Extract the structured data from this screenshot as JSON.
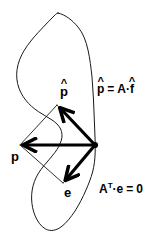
{
  "figure": {
    "background_color": "#ffffff",
    "ink_color": "#000000",
    "width": 161,
    "height": 240
  },
  "labels": {
    "p_hat": {
      "base": "p",
      "hat": "^",
      "text": "p̂"
    },
    "p": {
      "text": "p"
    },
    "e": {
      "text": "e"
    }
  },
  "equations": {
    "projection": {
      "lhs_base": "p",
      "lhs_hat": "^",
      "equals": "=",
      "rhs_matrix": "A",
      "rhs_dot": "·",
      "rhs_vector_base": "f",
      "rhs_vector_hat": "^",
      "text": "p̂ = A·f̂"
    },
    "orthogonality": {
      "matrix": "A",
      "transpose": "T",
      "dot": "·",
      "vector": "e",
      "equals": "=",
      "zero": "0",
      "text": "Aᵀ·e = 0"
    }
  },
  "geometry": {
    "origin": {
      "x": 95,
      "y": 145
    },
    "vectors": [
      {
        "name": "p-hat-vector",
        "from": {
          "x": 95,
          "y": 145
        },
        "to": {
          "x": 57,
          "y": 105
        },
        "stroke_width": 3.2
      },
      {
        "name": "p-vector",
        "from": {
          "x": 95,
          "y": 145
        },
        "to": {
          "x": 20,
          "y": 145
        },
        "stroke_width": 3.2
      },
      {
        "name": "e-vector",
        "from": {
          "x": 95,
          "y": 145
        },
        "to": {
          "x": 63,
          "y": 183
        },
        "stroke_width": 3.2
      }
    ],
    "thin_lines": [
      {
        "name": "p-tail-to-p-hat-tip",
        "from": {
          "x": 20,
          "y": 145
        },
        "to": {
          "x": 57,
          "y": 105
        }
      },
      {
        "name": "p-tail-to-e-tip",
        "from": {
          "x": 20,
          "y": 145
        },
        "to": {
          "x": 63,
          "y": 183
        }
      },
      {
        "name": "p-hat-tip-to-origin-thin",
        "from": {
          "x": 57,
          "y": 105
        },
        "to": {
          "x": 95,
          "y": 145
        }
      },
      {
        "name": "e-tip-to-origin-thin",
        "from": {
          "x": 63,
          "y": 183
        },
        "to": {
          "x": 95,
          "y": 145
        }
      }
    ],
    "subspace_blob": {
      "name": "column-space-blob",
      "description": "irregular hand-drawn closed region representing the column space of A"
    }
  },
  "label_positions": {
    "p_hat": {
      "x": 61,
      "y": 88
    },
    "p": {
      "x": 12,
      "y": 152
    },
    "e": {
      "x": 64,
      "y": 188
    },
    "projection_equation": {
      "x": 97,
      "y": 84
    },
    "orthogonality_equation": {
      "x": 99,
      "y": 183
    }
  }
}
